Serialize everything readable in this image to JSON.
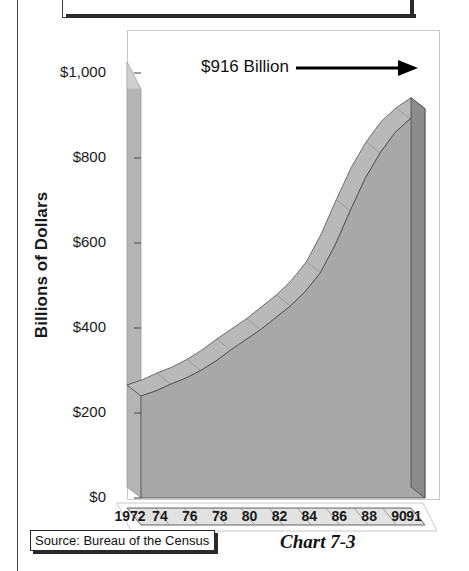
{
  "page": {
    "rule_color": "#4a4a4a",
    "top_box_label": ""
  },
  "annotation": {
    "label": "$916 Billion",
    "arrow": "right-arrow"
  },
  "source": {
    "label": "Source:  Bureau of the Census"
  },
  "caption": {
    "label": "Chart 7-3"
  },
  "colors": {
    "area_front": "#a8a8a8",
    "area_top": "#b9b9b9",
    "area_end_cap": "#8c8c8c",
    "axis_wall": "#b4b4b4",
    "floor": "#e2e2e2",
    "outline": "#3c3c3c",
    "text": "#1a1a1a"
  },
  "chart_data": {
    "type": "area",
    "title": "Chart 7-3",
    "subtitle": "",
    "xlabel": "",
    "ylabel": "Billions of Dollars",
    "ylim": [
      0,
      1000
    ],
    "ytick_labels": [
      "$1,000",
      "$800",
      "$600",
      "$400",
      "$200",
      "$0"
    ],
    "ytick_values": [
      1000,
      800,
      600,
      400,
      200,
      0
    ],
    "grid": false,
    "legend": "none",
    "annotations": [
      {
        "text": "$916 Billion",
        "points_to_year": 91,
        "value": 916
      }
    ],
    "categories": [
      "1972",
      "73",
      "74",
      "75",
      "76",
      "77",
      "78",
      "79",
      "80",
      "81",
      "82",
      "83",
      "84",
      "85",
      "86",
      "87",
      "88",
      "89",
      "90",
      "91"
    ],
    "xtick_labels": [
      "1972",
      "74",
      "76",
      "78",
      "80",
      "82",
      "84",
      "86",
      "88",
      "90",
      "91"
    ],
    "xtick_index": [
      0,
      2,
      4,
      6,
      8,
      10,
      12,
      14,
      16,
      18,
      19
    ],
    "series": [
      {
        "name": "Total",
        "values": [
          240,
          252,
          268,
          282,
          300,
          322,
          348,
          372,
          396,
          424,
          452,
          486,
          530,
          596,
          676,
          752,
          812,
          860,
          892,
          916
        ]
      }
    ]
  }
}
